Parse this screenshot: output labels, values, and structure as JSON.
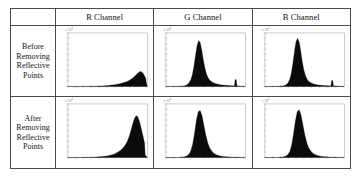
{
  "figure": {
    "name": "rgb-histogram-comparison-table",
    "corner_cell_label": "",
    "column_headers": [
      {
        "id": "r",
        "label": "R Channel"
      },
      {
        "id": "g",
        "label": "G Channel"
      },
      {
        "id": "b",
        "label": "B Channel"
      }
    ],
    "row_headers": [
      {
        "id": "before",
        "lines": [
          "Before",
          "Removing",
          "Reflective",
          "Points"
        ]
      },
      {
        "id": "after",
        "lines": [
          "After",
          "Removing",
          "Reflective",
          "Points"
        ]
      }
    ],
    "colors": {
      "border": "#4a4a4a",
      "axis": "#9a9a9a",
      "fill": "#0b0b0b",
      "text": "#121212",
      "background": "#ffffff"
    },
    "axis_exponent_label": "x 10",
    "axis_exponent_power": "4"
  },
  "chart_data": [
    {
      "id": "r-before",
      "type": "area",
      "title": "R Channel - Before Removing Reflective Points",
      "xlabel": "",
      "ylabel": "",
      "xlim": [
        0,
        255
      ],
      "ylim": [
        0,
        1
      ],
      "grid": false,
      "legend": "none",
      "xticks": [
        0,
        25,
        50,
        75,
        100,
        125,
        150,
        175,
        200,
        225,
        250
      ],
      "yticks": [
        0,
        0.1,
        0.2,
        0.3,
        0.4,
        0.5,
        0.6,
        0.7,
        0.8,
        0.9,
        1.0
      ],
      "annotation": "low skewed peak near high intensity, long left tail",
      "x": [
        0,
        10,
        20,
        30,
        40,
        50,
        60,
        70,
        80,
        90,
        100,
        110,
        120,
        130,
        140,
        150,
        160,
        170,
        180,
        190,
        195,
        200,
        205,
        210,
        215,
        220,
        225,
        228,
        230,
        232,
        234,
        236,
        238,
        240,
        242,
        244,
        246,
        248,
        250,
        252,
        255
      ],
      "values": [
        0,
        0,
        0,
        0,
        0,
        0.002,
        0.003,
        0.004,
        0.005,
        0.007,
        0.009,
        0.012,
        0.016,
        0.021,
        0.027,
        0.035,
        0.045,
        0.058,
        0.074,
        0.095,
        0.108,
        0.125,
        0.145,
        0.168,
        0.196,
        0.224,
        0.252,
        0.266,
        0.274,
        0.279,
        0.28,
        0.276,
        0.268,
        0.256,
        0.24,
        0.222,
        0.2,
        0.176,
        0.15,
        0.06,
        0
      ]
    },
    {
      "id": "g-before",
      "type": "area",
      "title": "G Channel - Before Removing Reflective Points",
      "xlabel": "",
      "ylabel": "",
      "xlim": [
        0,
        255
      ],
      "ylim": [
        0,
        1
      ],
      "grid": false,
      "legend": "none",
      "xticks": [
        0,
        25,
        50,
        75,
        100,
        125,
        150,
        175,
        200,
        225,
        250
      ],
      "yticks": [
        0,
        0.1,
        0.2,
        0.3,
        0.4,
        0.5,
        0.6,
        0.7,
        0.8,
        0.9,
        1.0
      ],
      "annotation": "tall central peak plus small saturation spike near x=225",
      "x": [
        0,
        20,
        40,
        50,
        60,
        65,
        70,
        75,
        80,
        85,
        90,
        95,
        100,
        105,
        110,
        115,
        120,
        125,
        130,
        135,
        140,
        150,
        160,
        170,
        180,
        190,
        200,
        210,
        215,
        220,
        222,
        224,
        226,
        228,
        230,
        240,
        255
      ],
      "values": [
        0,
        0,
        0.004,
        0.008,
        0.016,
        0.026,
        0.044,
        0.074,
        0.125,
        0.22,
        0.38,
        0.58,
        0.76,
        0.86,
        0.82,
        0.68,
        0.5,
        0.35,
        0.24,
        0.168,
        0.122,
        0.078,
        0.054,
        0.04,
        0.03,
        0.024,
        0.019,
        0.016,
        0.015,
        0.014,
        0.12,
        0.135,
        0.12,
        0.014,
        0.012,
        0.008,
        0
      ]
    },
    {
      "id": "b-before",
      "type": "area",
      "title": "B Channel - Before Removing Reflective Points",
      "xlabel": "",
      "ylabel": "",
      "xlim": [
        0,
        255
      ],
      "ylim": [
        0,
        1
      ],
      "grid": false,
      "legend": "none",
      "xticks": [
        0,
        25,
        50,
        75,
        100,
        125,
        150,
        175,
        200,
        225,
        250
      ],
      "yticks": [
        0,
        0.1,
        0.2,
        0.3,
        0.4,
        0.5,
        0.6,
        0.7,
        0.8,
        0.9,
        1.0
      ],
      "annotation": "tall narrow central peak plus small saturation spike near x=215",
      "x": [
        0,
        20,
        40,
        50,
        60,
        65,
        70,
        75,
        80,
        85,
        90,
        95,
        100,
        105,
        110,
        115,
        120,
        125,
        130,
        135,
        140,
        150,
        160,
        170,
        180,
        190,
        200,
        208,
        212,
        214,
        216,
        218,
        220,
        230,
        240,
        255
      ],
      "values": [
        0,
        0,
        0.004,
        0.008,
        0.015,
        0.024,
        0.042,
        0.078,
        0.14,
        0.255,
        0.44,
        0.66,
        0.84,
        0.9,
        0.83,
        0.66,
        0.46,
        0.31,
        0.205,
        0.14,
        0.1,
        0.062,
        0.042,
        0.031,
        0.024,
        0.019,
        0.015,
        0.013,
        0.012,
        0.105,
        0.118,
        0.104,
        0.012,
        0.009,
        0.006,
        0
      ]
    },
    {
      "id": "r-after",
      "type": "area",
      "title": "R Channel - After Removing Reflective Points",
      "xlabel": "",
      "ylabel": "",
      "xlim": [
        0,
        255
      ],
      "ylim": [
        0,
        1
      ],
      "grid": false,
      "legend": "none",
      "xticks": [
        0,
        25,
        50,
        75,
        100,
        125,
        150,
        175,
        200,
        225,
        250
      ],
      "yticks": [
        0,
        0.1,
        0.2,
        0.3,
        0.4,
        0.5,
        0.6,
        0.7,
        0.8,
        0.9,
        1.0
      ],
      "annotation": "tall skewed peak near high intensity with abrupt right cutoff",
      "x": [
        0,
        20,
        40,
        60,
        80,
        100,
        120,
        130,
        140,
        150,
        160,
        168,
        176,
        182,
        188,
        192,
        196,
        200,
        204,
        208,
        212,
        216,
        220,
        224,
        228,
        232,
        236,
        240,
        243,
        245,
        246,
        248,
        255
      ],
      "values": [
        0,
        0,
        0.002,
        0.004,
        0.008,
        0.014,
        0.026,
        0.035,
        0.048,
        0.068,
        0.1,
        0.13,
        0.175,
        0.215,
        0.27,
        0.32,
        0.385,
        0.455,
        0.54,
        0.625,
        0.7,
        0.755,
        0.78,
        0.76,
        0.705,
        0.625,
        0.53,
        0.43,
        0.35,
        0.3,
        0.28,
        0.05,
        0
      ]
    },
    {
      "id": "g-after",
      "type": "area",
      "title": "G Channel - After Removing Reflective Points",
      "xlabel": "",
      "ylabel": "",
      "xlim": [
        0,
        255
      ],
      "ylim": [
        0,
        1
      ],
      "grid": false,
      "legend": "none",
      "xticks": [
        0,
        25,
        50,
        75,
        100,
        125,
        150,
        175,
        200,
        225,
        250
      ],
      "yticks": [
        0,
        0.1,
        0.2,
        0.3,
        0.4,
        0.5,
        0.6,
        0.7,
        0.8,
        0.9,
        1.0
      ],
      "annotation": "tall narrow symmetric peak, saturation spike removed",
      "x": [
        0,
        20,
        40,
        50,
        60,
        68,
        74,
        80,
        86,
        92,
        98,
        104,
        110,
        116,
        122,
        128,
        134,
        140,
        148,
        156,
        164,
        174,
        184,
        194,
        204,
        214,
        224,
        234,
        244,
        255
      ],
      "values": [
        0,
        0,
        0.003,
        0.007,
        0.015,
        0.032,
        0.062,
        0.125,
        0.25,
        0.46,
        0.7,
        0.855,
        0.88,
        0.78,
        0.6,
        0.42,
        0.28,
        0.185,
        0.112,
        0.07,
        0.046,
        0.03,
        0.021,
        0.015,
        0.011,
        0.008,
        0.006,
        0.004,
        0.002,
        0
      ]
    },
    {
      "id": "b-after",
      "type": "area",
      "title": "B Channel - After Removing Reflective Points",
      "xlabel": "",
      "ylabel": "",
      "xlim": [
        0,
        255
      ],
      "ylim": [
        0,
        1
      ],
      "grid": false,
      "legend": "none",
      "xticks": [
        0,
        25,
        50,
        75,
        100,
        125,
        150,
        175,
        200,
        225,
        250
      ],
      "yticks": [
        0,
        0.1,
        0.2,
        0.3,
        0.4,
        0.5,
        0.6,
        0.7,
        0.8,
        0.9,
        1.0
      ],
      "annotation": "tall narrow symmetric peak, saturation spike removed",
      "x": [
        0,
        20,
        40,
        50,
        60,
        68,
        74,
        80,
        86,
        92,
        98,
        104,
        110,
        116,
        122,
        128,
        134,
        140,
        148,
        156,
        164,
        174,
        184,
        194,
        204,
        214,
        224,
        234,
        244,
        255
      ],
      "values": [
        0,
        0,
        0.003,
        0.006,
        0.013,
        0.028,
        0.056,
        0.115,
        0.235,
        0.445,
        0.69,
        0.86,
        0.89,
        0.79,
        0.61,
        0.425,
        0.285,
        0.188,
        0.115,
        0.072,
        0.047,
        0.031,
        0.022,
        0.016,
        0.011,
        0.008,
        0.006,
        0.004,
        0.002,
        0
      ]
    }
  ]
}
